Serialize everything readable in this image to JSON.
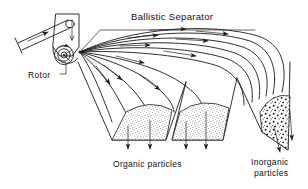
{
  "figure": {
    "title": "Ballistic Separator",
    "background_color": "#ffffff",
    "ink_color": "#1a1a1a",
    "labels": {
      "title": "Ballistic Separator",
      "rotor": "Rotor",
      "organic": "Organic particles",
      "inorganic_line1": "Inorganic",
      "inorganic_line2": "particles"
    },
    "components": [
      {
        "name": "feed-chute",
        "label": "feed chute"
      },
      {
        "name": "rotor",
        "label": "Rotor"
      },
      {
        "name": "hopper-left",
        "label": "organic collection hopper"
      },
      {
        "name": "hopper-middle",
        "label": "organic collection hopper"
      },
      {
        "name": "hopper-right",
        "label": "inorganic collection hopper"
      }
    ],
    "trajectory_count": 11,
    "hoppers": [
      {
        "name": "hopper-left",
        "contents": "Organic particles",
        "fill_texture": "fine-stipple"
      },
      {
        "name": "hopper-middle",
        "contents": "Organic particles",
        "fill_texture": "fine-stipple"
      },
      {
        "name": "hopper-right",
        "contents": "Inorganic particles",
        "fill_texture": "coarse-dots"
      }
    ]
  }
}
